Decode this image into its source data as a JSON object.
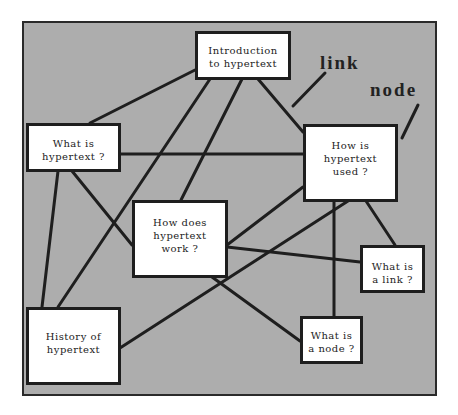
{
  "diagram": {
    "type": "hypertext-node-link-diagram",
    "colors": {
      "background": "#adadad",
      "node_fill": "#ffffff",
      "line": "#1e1e1e"
    },
    "annotations": {
      "link_label": "link",
      "node_label": "node"
    },
    "nodes": [
      {
        "id": "intro",
        "text": "Introduction\nto hypertext"
      },
      {
        "id": "what_is",
        "text": "What is\nhypertext ?"
      },
      {
        "id": "how_used",
        "text": "How is\nhypertext\nused ?"
      },
      {
        "id": "how_work",
        "text": "How does\nhypertext\nwork ?"
      },
      {
        "id": "what_link",
        "text": "What is\na link ?"
      },
      {
        "id": "what_node",
        "text": "What is\na node ?"
      },
      {
        "id": "history",
        "text": "History of\nhypertext"
      }
    ],
    "edges": [
      [
        "intro",
        "what_is"
      ],
      [
        "intro",
        "history"
      ],
      [
        "intro",
        "how_work"
      ],
      [
        "intro",
        "how_used"
      ],
      [
        "what_is",
        "how_used"
      ],
      [
        "what_is",
        "history"
      ],
      [
        "what_is",
        "how_work"
      ],
      [
        "how_work",
        "how_used"
      ],
      [
        "how_work",
        "what_link"
      ],
      [
        "how_work",
        "what_node"
      ],
      [
        "how_used",
        "what_node"
      ],
      [
        "how_used",
        "what_link"
      ],
      [
        "how_used",
        "history"
      ]
    ]
  }
}
